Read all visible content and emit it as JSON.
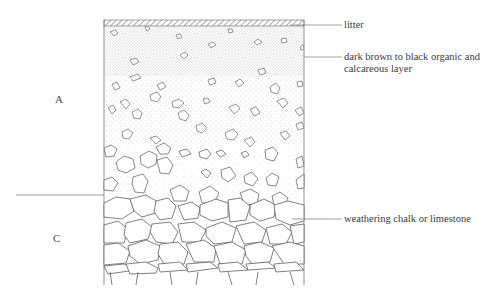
{
  "diagram": {
    "type": "soil-profile",
    "horizons": [
      {
        "id": "A",
        "label": "A"
      },
      {
        "id": "C",
        "label": "C"
      }
    ],
    "annotations": [
      {
        "id": "litter",
        "text": "litter"
      },
      {
        "id": "organic",
        "line1": "dark brown to black organic and",
        "line2": "calcareous layer"
      },
      {
        "id": "bedrock",
        "text": "weathering chalk or limestone"
      }
    ],
    "colors": {
      "ink": "#555555",
      "text": "#3a3a3a",
      "background": "#ffffff"
    }
  }
}
